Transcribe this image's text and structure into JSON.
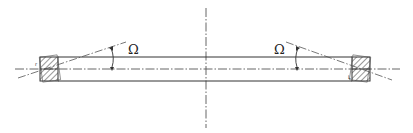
{
  "diagram": {
    "type": "engineering-cross-section",
    "labels": {
      "angle_left": "Ω",
      "angle_right": "Ω"
    },
    "colors": {
      "stroke": "#333333",
      "centerline": "#555555",
      "hatch": "#333333",
      "background": "#ffffff"
    },
    "geometry": {
      "vertical_axis_x": 206,
      "horizontal_axis_y": 69,
      "bar_top_y": 57,
      "bar_bottom_y": 81,
      "left_block": {
        "x": 40,
        "y": 57,
        "w": 18,
        "h": 24
      },
      "right_block": {
        "x": 352,
        "y": 57,
        "w": 18,
        "h": 24
      }
    }
  }
}
